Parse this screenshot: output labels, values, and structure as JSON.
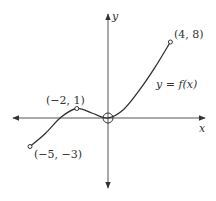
{
  "chart_data": {
    "type": "line",
    "title": "",
    "xlabel": "x",
    "ylabel": "y",
    "curve_label": "y = f(x)",
    "grid": false,
    "xlim": [
      -6.2,
      6.2
    ],
    "ylim": [
      -7.5,
      11.0
    ],
    "points": [
      {
        "x": -5,
        "y": -3,
        "label": "(−5, −3)",
        "marker": "closed"
      },
      {
        "x": -2,
        "y": 1,
        "label": "(−2, 1)",
        "marker": "closed"
      },
      {
        "x": 0,
        "y": 0,
        "label": "",
        "marker": "open"
      },
      {
        "x": 4,
        "y": 8,
        "label": "(4, 8)",
        "marker": "closed"
      }
    ],
    "curve_samples": [
      {
        "x": -5,
        "y": -3
      },
      {
        "x": -4,
        "y": -1.6
      },
      {
        "x": -3,
        "y": 0.1
      },
      {
        "x": -2,
        "y": 1
      },
      {
        "x": -1,
        "y": 0.5
      },
      {
        "x": 0,
        "y": 0
      },
      {
        "x": 1,
        "y": 0.9
      },
      {
        "x": 2,
        "y": 2.9
      },
      {
        "x": 3,
        "y": 5.3
      },
      {
        "x": 4,
        "y": 8
      }
    ]
  },
  "labels": {
    "x_axis": "x",
    "y_axis": "y",
    "function": "y = f(x)",
    "p1": "(−5, −3)",
    "p2": "(−2, 1)",
    "p3": "(4, 8)"
  }
}
